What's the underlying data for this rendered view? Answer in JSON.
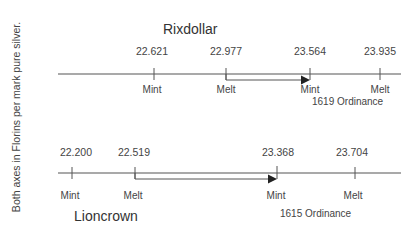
{
  "side_label": "Both axes in Florins per mark pure silver.",
  "axes": [
    {
      "name": "Rixdollar",
      "line_y": 74,
      "ticks": [
        {
          "value": "22.621",
          "label": "Mint",
          "x": 154
        },
        {
          "value": "22.977",
          "label": "Melt",
          "x": 226
        },
        {
          "value": "23.564",
          "label": "Mint",
          "x": 310
        },
        {
          "value": "23.935",
          "label": "Melt",
          "x": 380
        }
      ],
      "arrow": {
        "from_x": 226,
        "to_x": 310
      },
      "ordinance": "1619 Ordinance"
    },
    {
      "name": "Lioncrown",
      "line_y": 173,
      "ticks": [
        {
          "value": "22.200",
          "label": "Mint",
          "x": 72
        },
        {
          "value": "22.519",
          "label": "Melt",
          "x": 135
        },
        {
          "value": "23.368",
          "label": "Mint",
          "x": 277
        },
        {
          "value": "23.704",
          "label": "Melt",
          "x": 355
        }
      ],
      "arrow": {
        "from_x": 135,
        "to_x": 277
      },
      "ordinance": "1615 Ordinance"
    }
  ],
  "colors": {
    "line": "#555555",
    "text": "#444444"
  }
}
